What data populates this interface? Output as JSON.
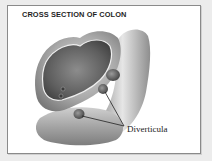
{
  "figure": {
    "title": "CROSS SECTION OF COLON",
    "callout_label": "Diverticula",
    "colors": {
      "background": "#ececec",
      "frame_fill": "#ffffff",
      "frame_border": "#8a8a8a",
      "title_text": "#1e1e1e",
      "leader_line": "#222222"
    }
  }
}
